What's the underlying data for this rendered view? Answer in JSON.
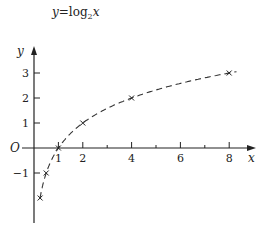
{
  "chart_data": {
    "type": "line",
    "title_parts": {
      "y": "y",
      "eq": "=log",
      "sub": "2",
      "x": "x"
    },
    "xlabel": "x",
    "ylabel": "y",
    "origin_label": "O",
    "x_ticks": [
      1,
      2,
      4,
      6,
      8
    ],
    "x_minor_ticks": [
      3,
      5,
      7
    ],
    "y_ticks": [
      3,
      2,
      1,
      -1
    ],
    "xlim": [
      0,
      9
    ],
    "ylim": [
      -3,
      4
    ],
    "grid": false,
    "line_style": "dashed",
    "marked_points": [
      {
        "x": 0.25,
        "y": -2
      },
      {
        "x": 0.5,
        "y": -1
      },
      {
        "x": 1,
        "y": 0
      },
      {
        "x": 2,
        "y": 1
      },
      {
        "x": 4,
        "y": 2
      },
      {
        "x": 8,
        "y": 3
      }
    ],
    "curve_range": [
      0.25,
      8.3
    ]
  },
  "labels": {
    "x_ticks": [
      "1",
      "2",
      "4",
      "6",
      "8"
    ],
    "y_ticks": [
      "3",
      "2",
      "1",
      "−1"
    ]
  }
}
